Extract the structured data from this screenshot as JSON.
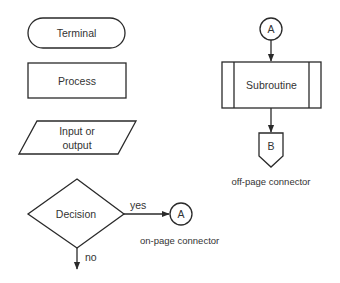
{
  "diagram": {
    "type": "flowchart-symbol-legend",
    "colors": {
      "stroke": "#2a2a2a",
      "text": "#333333",
      "background": "#ffffff"
    },
    "shapes": {
      "terminal": {
        "label": "Terminal",
        "shape": "rounded-rectangle"
      },
      "process": {
        "label": "Process",
        "shape": "rectangle"
      },
      "input_output": {
        "label_line1": "Input or",
        "label_line2": "output",
        "shape": "parallelogram"
      },
      "decision": {
        "label": "Decision",
        "shape": "diamond",
        "yes_label": "yes",
        "no_label": "no"
      },
      "on_page_connector": {
        "label": "A",
        "caption": "on-page connector",
        "shape": "circle"
      },
      "top_connector": {
        "label": "A",
        "shape": "circle"
      },
      "subroutine": {
        "label": "Subroutine",
        "shape": "rectangle-with-double-sides"
      },
      "off_page_connector": {
        "label": "B",
        "caption": "off-page connector",
        "shape": "pentagon"
      }
    }
  }
}
